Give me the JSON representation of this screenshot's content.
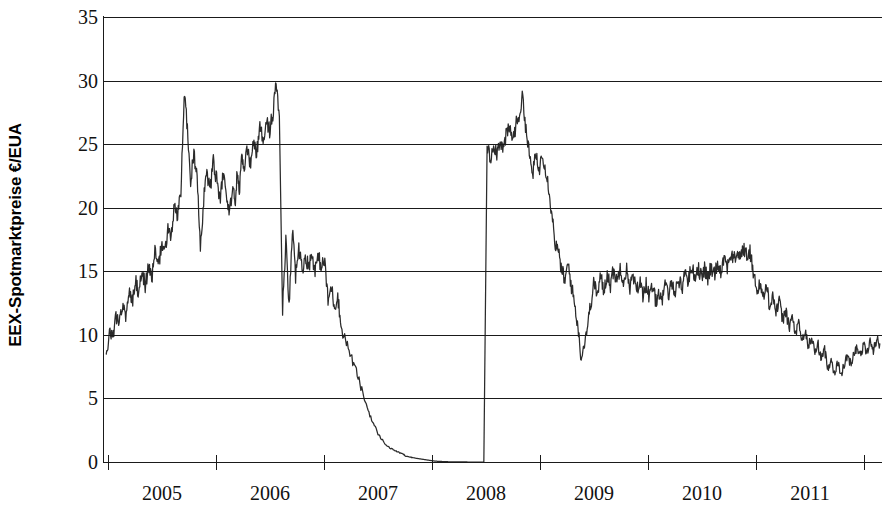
{
  "chart_data": {
    "type": "line",
    "title": "",
    "xlabel": "",
    "ylabel": "EEX-Spotmarktpreise €/EUA",
    "ylim": [
      0,
      35
    ],
    "xlim": [
      2004.8,
      2012.0
    ],
    "ytick_labels": [
      "0",
      "5",
      "10",
      "15",
      "20",
      "25",
      "30",
      "35"
    ],
    "ytick_values": [
      0,
      5,
      10,
      15,
      20,
      25,
      30,
      35
    ],
    "xtick_labels": [
      "2005",
      "2006",
      "2007",
      "2008",
      "2009",
      "2010",
      "2011"
    ],
    "xtick_values": [
      2005,
      2006,
      2007,
      2008,
      2009,
      2010,
      2011
    ],
    "grid": true,
    "legend": "none",
    "series": [
      {
        "name": "EEX Spot EUA",
        "color": "#2b2b2b",
        "x": [
          2004.83,
          2004.86,
          2004.89,
          2004.92,
          2004.95,
          2004.98,
          2005.01,
          2005.04,
          2005.07,
          2005.1,
          2005.13,
          2005.16,
          2005.19,
          2005.22,
          2005.25,
          2005.28,
          2005.31,
          2005.34,
          2005.37,
          2005.4,
          2005.43,
          2005.46,
          2005.49,
          2005.52,
          2005.55,
          2005.58,
          2005.61,
          2005.64,
          2005.67,
          2005.7,
          2005.73,
          2005.76,
          2005.79,
          2005.82,
          2005.85,
          2005.88,
          2005.91,
          2005.94,
          2005.97,
          2006.0,
          2006.02,
          2006.04,
          2006.06,
          2006.08,
          2006.1,
          2006.13,
          2006.16,
          2006.19,
          2006.22,
          2006.25,
          2006.28,
          2006.31,
          2006.34,
          2006.37,
          2006.4,
          2006.43,
          2006.46,
          2006.49,
          2006.52,
          2006.55,
          2006.58,
          2006.61,
          2006.64,
          2006.67,
          2006.7,
          2006.73,
          2006.76,
          2006.79,
          2006.82,
          2006.85,
          2006.88,
          2006.91,
          2006.94,
          2006.97,
          2007.0,
          2007.05,
          2007.1,
          2007.15,
          2007.2,
          2007.25,
          2007.3,
          2007.35,
          2007.4,
          2007.45,
          2007.5,
          2007.55,
          2007.58,
          2007.59,
          2007.6,
          2007.63,
          2007.66,
          2007.69,
          2007.72,
          2007.75,
          2007.78,
          2007.81,
          2007.84,
          2007.87,
          2007.9,
          2007.93,
          2007.96,
          2007.99,
          2008.02,
          2008.05,
          2008.08,
          2008.11,
          2008.14,
          2008.17,
          2008.2,
          2008.23,
          2008.26,
          2008.29,
          2008.32,
          2008.35,
          2008.38,
          2008.41,
          2008.44,
          2008.47,
          2008.5,
          2008.53,
          2008.56,
          2008.59,
          2008.62,
          2008.65,
          2008.68,
          2008.71,
          2008.74,
          2008.77,
          2008.8,
          2008.83,
          2008.86,
          2008.89,
          2008.92,
          2008.95,
          2008.98,
          2009.01,
          2009.04,
          2009.07,
          2009.1,
          2009.13,
          2009.16,
          2009.19,
          2009.22,
          2009.25,
          2009.28,
          2009.31,
          2009.34,
          2009.37,
          2009.4,
          2009.43,
          2009.46,
          2009.49,
          2009.52,
          2009.55,
          2009.58,
          2009.61,
          2009.64,
          2009.67,
          2009.7,
          2009.73,
          2009.76,
          2009.79,
          2009.82,
          2009.85,
          2009.88,
          2009.91,
          2009.94,
          2009.97,
          2010.0,
          2010.03,
          2010.06,
          2010.09,
          2010.12,
          2010.15,
          2010.18,
          2010.21,
          2010.24,
          2010.27,
          2010.3,
          2010.33,
          2010.36,
          2010.39,
          2010.42,
          2010.45,
          2010.48,
          2010.51,
          2010.54,
          2010.57,
          2010.6,
          2010.63,
          2010.66,
          2010.69,
          2010.72,
          2010.75,
          2010.78,
          2010.81,
          2010.84,
          2010.87,
          2010.9,
          2010.93,
          2010.96,
          2010.99,
          2011.02,
          2011.05,
          2011.08,
          2011.11,
          2011.14,
          2011.17,
          2011.2,
          2011.23,
          2011.26,
          2011.29,
          2011.32,
          2011.35,
          2011.38,
          2011.41,
          2011.44,
          2011.47,
          2011.5,
          2011.53,
          2011.56,
          2011.59,
          2011.62,
          2011.65,
          2011.68,
          2011.71,
          2011.74,
          2011.77,
          2011.8,
          2011.83,
          2011.86,
          2011.89,
          2011.92,
          2011.95,
          2011.98
        ],
        "y": [
          8.3,
          10.2,
          9.8,
          11.5,
          10.8,
          12.4,
          11.6,
          13.5,
          12.6,
          14.2,
          13.4,
          14.9,
          13.9,
          15.3,
          14.4,
          16.5,
          15.2,
          17.1,
          16.3,
          18.4,
          17.6,
          20.1,
          19.2,
          21.3,
          28.9,
          26.4,
          21.9,
          24.5,
          22.1,
          16.8,
          20.6,
          22.8,
          21.4,
          23.6,
          22.2,
          20.4,
          22.7,
          21.1,
          19.6,
          21.8,
          20.3,
          22.6,
          21.4,
          23.8,
          22.9,
          24.6,
          23.4,
          25.1,
          24.3,
          26.2,
          25.4,
          26.9,
          26.1,
          27.4,
          29.8,
          27.2,
          11.9,
          17.4,
          12.1,
          18.3,
          14.6,
          16.9,
          15.1,
          16.2,
          15.4,
          16.3,
          15.2,
          16.1,
          15.4,
          15.8,
          12.6,
          13.8,
          12.2,
          13.1,
          10.6,
          9.4,
          8.1,
          6.9,
          5.4,
          4.1,
          3.0,
          2.1,
          1.5,
          1.1,
          0.9,
          0.7,
          0.6,
          0.5,
          0.45,
          0.4,
          0.35,
          0.3,
          0.26,
          0.22,
          0.18,
          0.14,
          0.1,
          0.07,
          0.05,
          0.04,
          0.03,
          0.02,
          0.02,
          0.01,
          0.01,
          0.01,
          0.01,
          0.0,
          0.0,
          0.0,
          0.0,
          0.0,
          0.0,
          24.9,
          23.8,
          25.1,
          24.3,
          25.4,
          24.6,
          25.8,
          26.2,
          25.4,
          26.6,
          27.4,
          28.8,
          26.1,
          24.2,
          22.6,
          24.1,
          22.9,
          24.4,
          23.1,
          21.6,
          19.4,
          17.2,
          16.4,
          15.1,
          14.2,
          15.6,
          13.8,
          12.4,
          10.6,
          8.1,
          9.4,
          10.8,
          12.6,
          14.2,
          13.1,
          14.6,
          13.4,
          14.9,
          13.9,
          15.2,
          14.1,
          15.4,
          14.3,
          15.1,
          13.8,
          14.6,
          13.4,
          14.2,
          13.2,
          14.1,
          12.9,
          13.8,
          12.6,
          13.4,
          12.8,
          13.9,
          13.1,
          14.2,
          13.4,
          14.4,
          13.6,
          15.1,
          14.2,
          15.4,
          14.6,
          15.3,
          14.5,
          15.2,
          14.4,
          15.3,
          14.8,
          15.6,
          15.1,
          16.1,
          15.4,
          16.4,
          15.8,
          16.6,
          16.1,
          16.8,
          16.2,
          16.5,
          15.1,
          13.4,
          14.2,
          12.8,
          13.9,
          12.4,
          13.2,
          11.8,
          12.6,
          11.2,
          11.9,
          10.6,
          11.4,
          10.1,
          10.8,
          9.6,
          10.2,
          9.1,
          9.8,
          8.6,
          9.2,
          8.1,
          8.8,
          7.4,
          8.1,
          7.0,
          7.8,
          6.9,
          7.6,
          8.4,
          7.7,
          8.6,
          9.1,
          8.4,
          9.2,
          8.6,
          9.4,
          8.9,
          9.6,
          9.3
        ]
      }
    ],
    "annotations": [
      {
        "text": "Phase I / Phase II break: vertical step from 0 to ~25 in mid-2007"
      }
    ]
  },
  "axis": {
    "y_title": "EEX-Spotmarktpreise €/EUA",
    "y_ticks": [
      "35",
      "30",
      "25",
      "20",
      "15",
      "10",
      "5",
      "0"
    ],
    "x_ticks": [
      "2005",
      "2006",
      "2007",
      "2008",
      "2009",
      "2010",
      "2011"
    ]
  }
}
